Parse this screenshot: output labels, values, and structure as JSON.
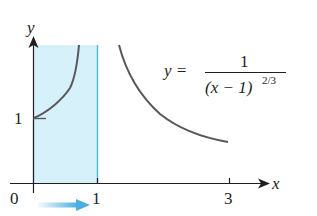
{
  "figure": {
    "function_label": {
      "lhs": "y =",
      "numerator": "1",
      "denominator_base": "(x − 1)",
      "denominator_exponent": "2/3"
    },
    "axes": {
      "x_label": "x",
      "y_label": "y",
      "origin_label": "0",
      "x_ticks": [
        {
          "value": 1,
          "label": "1"
        },
        {
          "value": 3,
          "label": "3"
        }
      ],
      "y_ticks": [
        {
          "value": 1,
          "label": "1"
        }
      ]
    },
    "shaded_region": {
      "from_x": 0,
      "to_x": 1,
      "color": "#d6f1fa",
      "edge_color": "#4fb6dc"
    },
    "arrow": {
      "direction": "right",
      "color": "#4aaee0"
    },
    "curve_color": "#58585a",
    "axis_color": "#231f20"
  }
}
